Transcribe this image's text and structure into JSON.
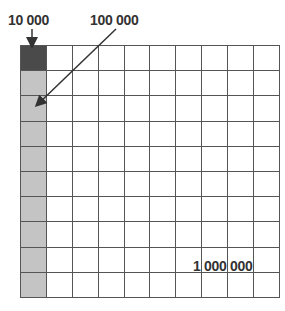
{
  "labels": {
    "ten_thousand": "10 000",
    "hundred_thousand": "100 000",
    "million": "1 000 000"
  },
  "grid": {
    "rows": 10,
    "cols": 10,
    "dark_cells": 1,
    "light_column_cells": 9
  },
  "colors": {
    "dark": "#4a4a4a",
    "light": "#c4c4c4",
    "line": "#555555"
  }
}
